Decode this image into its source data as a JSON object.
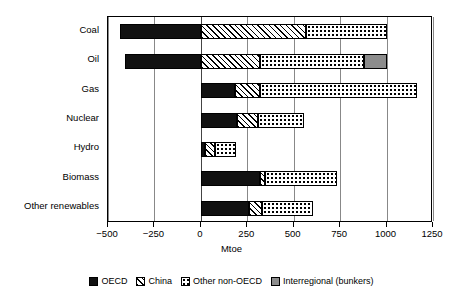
{
  "chart_data": {
    "type": "bar",
    "orientation": "horizontal",
    "stacked": true,
    "title": "",
    "xlabel": "Mtoe",
    "ylabel": "",
    "xlim": [
      -500,
      1250
    ],
    "xticks": [
      -500,
      -250,
      0,
      250,
      500,
      750,
      1000,
      1250
    ],
    "xticklabels": [
      "−500",
      "−250",
      "0",
      "250",
      "500",
      "750",
      "1000",
      "1250"
    ],
    "grid": "vertical",
    "legend_position": "bottom",
    "categories": [
      "Coal",
      "Oil",
      "Gas",
      "Nuclear",
      "Hydro",
      "Biomass",
      "Other renewables"
    ],
    "series": [
      {
        "name": "OECD",
        "color": "#111111",
        "pattern": "solid-black",
        "values": [
          -435,
          -408,
          185,
          195,
          20,
          320,
          260
        ]
      },
      {
        "name": "China",
        "color": "#000000",
        "pattern": "diagonal-hatch",
        "values": [
          565,
          320,
          135,
          115,
          55,
          25,
          70
        ]
      },
      {
        "name": "Other non-OECD",
        "color": "#000000",
        "pattern": "dotted",
        "values": [
          435,
          560,
          845,
          245,
          115,
          390,
          275
        ]
      },
      {
        "name": "Interregional (bunkers)",
        "color": "#8c8c8c",
        "pattern": "solid-grey",
        "values": [
          0,
          120,
          0,
          0,
          0,
          0,
          0
        ]
      }
    ],
    "positive_totals": [
      1000,
      1000,
      1165,
      555,
      190,
      735,
      605
    ],
    "negative_totals": [
      -435,
      -408,
      0,
      0,
      0,
      0,
      0
    ],
    "segment_breakdown": [
      {
        "category": "Coal",
        "OECD": -435,
        "China": 565,
        "Other non-OECD": 435,
        "Interregional (bunkers)": 0
      },
      {
        "category": "Oil",
        "OECD": -408,
        "China": 320,
        "Other non-OECD": 560,
        "Interregional (bunkers)": 120
      },
      {
        "category": "Gas",
        "OECD": 185,
        "China": 135,
        "Other non-OECD": 845,
        "Interregional (bunkers)": 0
      },
      {
        "category": "Nuclear",
        "OECD": 195,
        "China": 115,
        "Other non-OECD": 245,
        "Interregional (bunkers)": 0
      },
      {
        "category": "Hydro",
        "OECD": 20,
        "China": 55,
        "Other non-OECD": 115,
        "Interregional (bunkers)": 0
      },
      {
        "category": "Biomass",
        "OECD": 320,
        "China": 25,
        "Other non-OECD": 390,
        "Interregional (bunkers)": 0
      },
      {
        "category": "Other renewables",
        "OECD": 260,
        "China": 70,
        "Other non-OECD": 275,
        "Interregional (bunkers)": 0
      }
    ]
  },
  "axis": {
    "x_title": "Mtoe"
  },
  "legend": {
    "items": [
      {
        "label": "OECD",
        "swatch": "solid-black-swatch"
      },
      {
        "label": "China",
        "swatch": "hatched-swatch"
      },
      {
        "label": "Other non-OECD",
        "swatch": "dotted-swatch"
      },
      {
        "label": "Interregional (bunkers)",
        "swatch": "grey-swatch"
      }
    ]
  }
}
